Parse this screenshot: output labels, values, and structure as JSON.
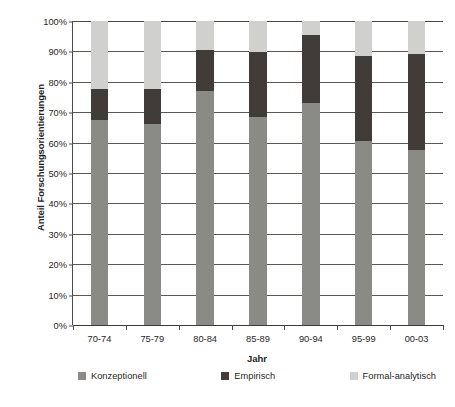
{
  "chart_data": {
    "type": "bar",
    "subtype": "stacked-100-percent",
    "title": "",
    "xlabel": "Jahr",
    "ylabel": "Anteil Forschungsorientierungen",
    "categories": [
      "70-74",
      "75-79",
      "80-84",
      "85-89",
      "90-94",
      "95-99",
      "00-03"
    ],
    "series": [
      {
        "name": "Konzeptionell",
        "color": "#8a8a87",
        "values": [
          67.5,
          66.0,
          77.0,
          68.5,
          73.0,
          60.5,
          57.5
        ]
      },
      {
        "name": "Empirisch",
        "color": "#413c39",
        "values": [
          10.0,
          11.5,
          13.5,
          21.3,
          22.5,
          28.0,
          31.8
        ]
      },
      {
        "name": "Formal-analytisch",
        "color": "#d0d0cf",
        "values": [
          22.5,
          22.5,
          9.5,
          10.2,
          4.5,
          11.5,
          10.7
        ]
      }
    ],
    "ylim": [
      0,
      100
    ],
    "ytick_values": [
      0,
      10,
      20,
      30,
      40,
      50,
      60,
      70,
      80,
      90,
      100
    ],
    "ytick_labels": [
      "0%",
      "10%",
      "20%",
      "30%",
      "40%",
      "50%",
      "60%",
      "70%",
      "80%",
      "90%",
      "100%"
    ],
    "grid": true,
    "grid_axis": "y",
    "legend_position": "bottom",
    "legend_entries": [
      "Konzeptionell",
      "Empirisch",
      "Formal-analytisch"
    ]
  },
  "axes": {
    "y_title": "Anteil Forschungsorientierungen",
    "x_title": "Jahr"
  },
  "legend": {
    "items": [
      {
        "label": "Konzeptionell",
        "color": "#8a8a87"
      },
      {
        "label": "Empirisch",
        "color": "#413c39"
      },
      {
        "label": "Formal-analytisch",
        "color": "#d0d0cf"
      }
    ]
  },
  "caption": {
    "text": ""
  },
  "colors": {
    "konzeptionell": "#8a8a87",
    "empirisch": "#413c39",
    "formal_analytisch": "#d0d0cf",
    "axis": "#4a4a48",
    "gridline": "#595855",
    "text": "#2a2725",
    "background": "#ffffff"
  }
}
